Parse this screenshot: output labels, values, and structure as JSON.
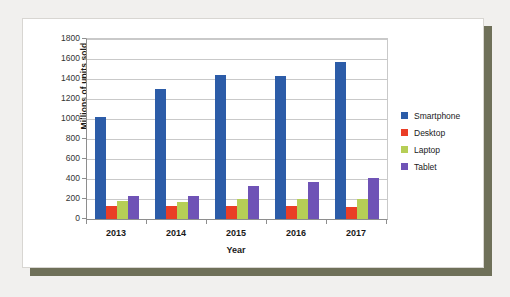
{
  "chart_data": {
    "type": "bar",
    "title": "",
    "xlabel": "Year",
    "ylabel": "Millions of units sold",
    "categories": [
      "2013",
      "2014",
      "2015",
      "2016",
      "2017"
    ],
    "ylim": [
      0,
      1800
    ],
    "ytick_step": 200,
    "yticks": [
      0,
      200,
      400,
      600,
      800,
      1000,
      1200,
      1400,
      1600,
      1800
    ],
    "grid": true,
    "legend_position": "right",
    "series": [
      {
        "name": "Smartphone",
        "color": "#2c5ca8",
        "values": [
          1020,
          1300,
          1440,
          1430,
          1570
        ]
      },
      {
        "name": "Desktop",
        "color": "#ea3d26",
        "values": [
          135,
          133,
          130,
          128,
          120
        ]
      },
      {
        "name": "Laptop",
        "color": "#b6ce56",
        "values": [
          185,
          175,
          200,
          197,
          198
        ]
      },
      {
        "name": "Tablet",
        "color": "#6f53b6",
        "values": [
          235,
          232,
          330,
          370,
          410
        ]
      }
    ]
  }
}
